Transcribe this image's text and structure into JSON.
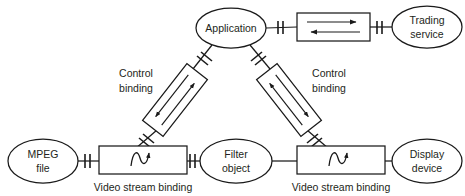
{
  "diagram": {
    "background_color": "#ffffff",
    "line_color": "#1a1a1a",
    "text_color": "#231f20",
    "nodes": [
      {
        "id": "application",
        "type": "ellipse",
        "label_line1": "Application",
        "label_line2": "",
        "cx": 231,
        "cy": 28,
        "rx": 35,
        "ry": 20
      },
      {
        "id": "trading-service",
        "type": "ellipse",
        "label_line1": "Trading",
        "label_line2": "service",
        "cx": 427,
        "cy": 27,
        "rx": 35,
        "ry": 21
      },
      {
        "id": "mpeg-file",
        "type": "ellipse",
        "label_line1": "MPEG",
        "label_line2": "file",
        "cx": 43,
        "cy": 161,
        "rx": 35,
        "ry": 22
      },
      {
        "id": "filter-object",
        "type": "ellipse",
        "label_line1": "Filter",
        "label_line2": "object",
        "cx": 236,
        "cy": 161,
        "rx": 36,
        "ry": 22
      },
      {
        "id": "display-device",
        "type": "ellipse",
        "label_line1": "Display",
        "label_line2": "device",
        "cx": 427,
        "cy": 161,
        "rx": 35,
        "ry": 22
      }
    ],
    "bindings": [
      {
        "id": "trading-binding",
        "style": "horizontal-box-two-arrows",
        "label": "",
        "x": 297,
        "y": 13,
        "w": 73,
        "h": 28
      },
      {
        "id": "control-binding-left",
        "style": "tilted-box-two-arrows",
        "label_line1": "Control",
        "label_line2": "binding",
        "label_x": 136,
        "label_y": 80,
        "cx": 175,
        "cy": 100,
        "w": 26,
        "h": 72,
        "rotate": 38
      },
      {
        "id": "control-binding-right",
        "style": "tilted-box-two-arrows",
        "label_line1": "Control",
        "label_line2": "binding",
        "label_x": 329,
        "label_y": 80,
        "cx": 289,
        "cy": 100,
        "w": 26,
        "h": 72,
        "rotate": -38
      },
      {
        "id": "video-stream-binding-left",
        "style": "wave-box",
        "label": "Video stream binding",
        "label_x": 143,
        "label_y": 188,
        "x": 99,
        "y": 146,
        "w": 88,
        "h": 28
      },
      {
        "id": "video-stream-binding-right",
        "style": "wave-box",
        "label": "Video stream binding",
        "label_x": 341,
        "label_y": 188,
        "x": 297,
        "y": 146,
        "w": 88,
        "h": 28
      }
    ],
    "connectors": [
      {
        "id": "app-to-trading-binding",
        "from": "application",
        "to": "trading-binding",
        "has_tick": true
      },
      {
        "id": "trading-binding-to-service",
        "from": "trading-binding",
        "to": "trading-service",
        "has_tick": true
      },
      {
        "id": "app-to-control-left",
        "from": "application",
        "to": "control-binding-left",
        "has_tick": true
      },
      {
        "id": "app-to-control-right",
        "from": "application",
        "to": "control-binding-right",
        "has_tick": true
      },
      {
        "id": "control-left-to-video-left",
        "from": "control-binding-left",
        "to": "video-stream-binding-left",
        "has_tick": true
      },
      {
        "id": "control-right-to-video-right",
        "from": "control-binding-right",
        "to": "video-stream-binding-right",
        "has_tick": true
      },
      {
        "id": "mpeg-to-video-left",
        "from": "mpeg-file",
        "to": "video-stream-binding-left",
        "has_tick": true
      },
      {
        "id": "video-left-to-filter",
        "from": "video-stream-binding-left",
        "to": "filter-object",
        "has_tick": true
      },
      {
        "id": "filter-to-video-right",
        "from": "filter-object",
        "to": "video-stream-binding-right",
        "has_tick": false
      },
      {
        "id": "video-right-to-display",
        "from": "video-stream-binding-right",
        "to": "display-device",
        "has_tick": false
      }
    ]
  }
}
